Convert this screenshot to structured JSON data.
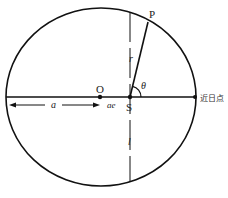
{
  "diagram": {
    "labels": {
      "point_p": "P",
      "center_o": "O",
      "focus_s": "S",
      "radius_r": "r",
      "angle_theta": "θ",
      "semi_major_a": "a",
      "focal_offset_ae": "ae",
      "semi_latus_l": "l",
      "perihelion": "近日点"
    },
    "colors": {
      "stroke": "#111111",
      "text": "#222222",
      "background": "#ffffff"
    }
  }
}
